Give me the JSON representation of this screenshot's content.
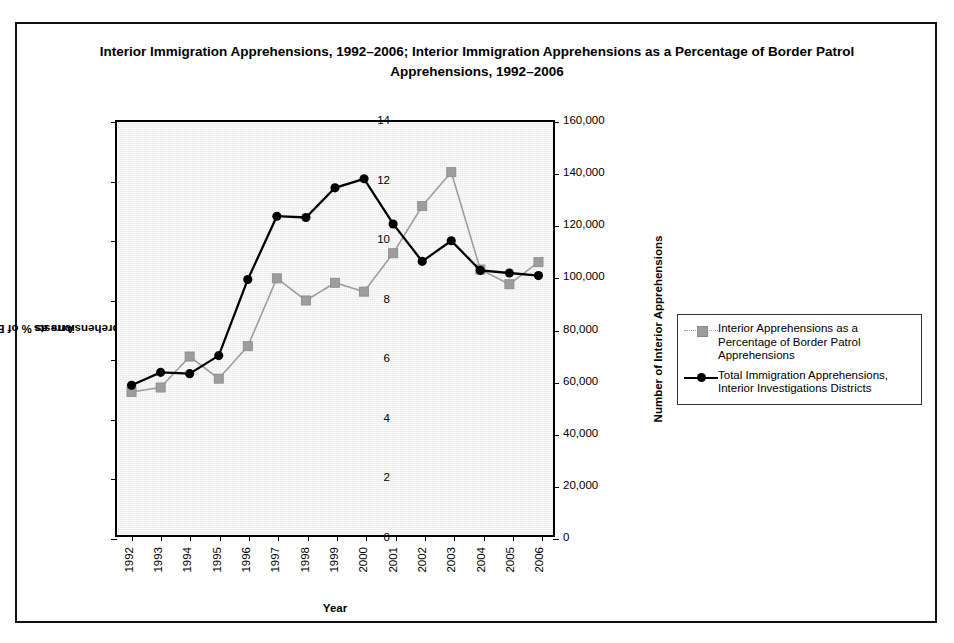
{
  "figure": {
    "title": "Interior Immigration Apprehensions, 1992–2006; Interior Immigration Apprehensions as a Percentage of Border Patrol Apprehensions, 1992–2006"
  },
  "axes": {
    "x_title": "Year",
    "y_left_title_line1": "Interior Apprehensions as % of Border Patrol",
    "y_left_title_line2": "Arrests",
    "y_right_title": "Number of Interior Apprehensions"
  },
  "legend": {
    "items": [
      {
        "label": "Interior Apprehensions as a Percentage of Border Patrol Apprehensions",
        "marker": "square-marker",
        "line": "dotted",
        "color": "#9d9d9d"
      },
      {
        "label": "Total Immigration Apprehensions, Interior Investigations Districts",
        "marker": "circle-marker",
        "line": "solid",
        "color": "#000000"
      }
    ]
  },
  "chart_data": {
    "type": "line",
    "title": "Interior Immigration Apprehensions, 1992–2006; Interior Immigration Apprehensions as a Percentage of Border Patrol Apprehensions, 1992–2006",
    "xlabel": "Year",
    "ylabel": "Interior Apprehensions as % of Border Patrol Arrests",
    "y2label": "Number of Interior Apprehensions",
    "grid": false,
    "legend_position": "right",
    "x": [
      1992,
      1993,
      1994,
      1995,
      1996,
      1997,
      1998,
      1999,
      2000,
      2001,
      2002,
      2003,
      2004,
      2005,
      2006
    ],
    "xtick_labels": [
      "1992",
      "1993",
      "1994",
      "1995",
      "1996",
      "1997",
      "1998",
      "1999",
      "2000",
      "2001",
      "2002",
      "2003",
      "2004",
      "2005",
      "2006"
    ],
    "ylim": [
      0,
      14
    ],
    "ytick_labels": [
      "0",
      "2",
      "4",
      "6",
      "8",
      "10",
      "12",
      "14"
    ],
    "ytick_values": [
      0,
      2,
      4,
      6,
      8,
      10,
      12,
      14
    ],
    "y2lim": [
      0,
      160000
    ],
    "y2tick_labels": [
      "0",
      "20,000",
      "40,000",
      "60,000",
      "80,000",
      "100,000",
      "120,000",
      "140,000",
      "160,000"
    ],
    "y2tick_values": [
      0,
      20000,
      40000,
      60000,
      80000,
      100000,
      120000,
      140000,
      160000
    ],
    "series": [
      {
        "name": "Interior Apprehensions as a Percentage of Border Patrol Apprehensions",
        "axis": "left",
        "color": "#9d9d9d",
        "line_style": "dotted",
        "marker": "square",
        "values": [
          4.85,
          5.0,
          6.05,
          5.3,
          6.4,
          8.7,
          7.95,
          8.55,
          8.25,
          9.55,
          11.15,
          12.3,
          9.0,
          8.5,
          9.25
        ]
      },
      {
        "name": "Total Immigration Apprehensions, Interior Investigations Districts",
        "axis": "right",
        "color": "#000000",
        "line_style": "solid",
        "marker": "circle",
        "values": [
          58000,
          63000,
          62500,
          69500,
          99000,
          123500,
          123000,
          134500,
          138000,
          120500,
          106000,
          114000,
          102500,
          101500,
          100500
        ]
      }
    ]
  }
}
